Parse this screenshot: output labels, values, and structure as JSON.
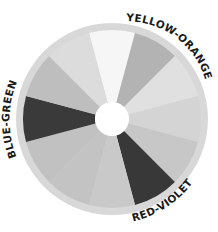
{
  "diagram": {
    "segments": [
      {
        "name": "yellow",
        "center_angle_deg": 270,
        "color": "#f6f6f6"
      },
      {
        "name": "yellow-orange",
        "center_angle_deg": 300,
        "color": "#b3b3b3",
        "label": "YELLOW-ORANGE"
      },
      {
        "name": "orange",
        "center_angle_deg": 330,
        "color": "#e0e0e0"
      },
      {
        "name": "red-orange",
        "center_angle_deg": 0,
        "color": "#d4d4d4"
      },
      {
        "name": "red",
        "center_angle_deg": 30,
        "color": "#c7c7c7"
      },
      {
        "name": "red-violet",
        "center_angle_deg": 60,
        "color": "#383838",
        "label": "RED-VIOLET"
      },
      {
        "name": "violet",
        "center_angle_deg": 90,
        "color": "#c9c9c9"
      },
      {
        "name": "blue-violet",
        "center_angle_deg": 120,
        "color": "#c3c3c3"
      },
      {
        "name": "blue",
        "center_angle_deg": 150,
        "color": "#c1c1c1"
      },
      {
        "name": "blue-green",
        "center_angle_deg": 180,
        "color": "#3a3a3a",
        "label": "BLUE-GREEN"
      },
      {
        "name": "green",
        "center_angle_deg": 210,
        "color": "#bebebe"
      },
      {
        "name": "yellow-green",
        "center_angle_deg": 240,
        "color": "#dcdcdc"
      }
    ],
    "ring_color": "#d8d8d8",
    "hole_color": "#ffffff",
    "labels": {
      "yellow_orange": "YELLOW-ORANGE",
      "blue_green": "BLUE-GREEN",
      "red_violet": "RED-VIOLET"
    }
  }
}
